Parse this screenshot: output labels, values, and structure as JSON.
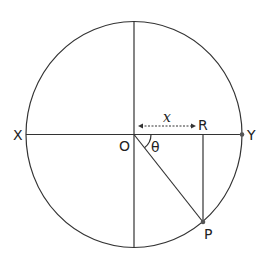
{
  "diagram": {
    "labels": {
      "X": "X",
      "Y": "Y",
      "O": "O",
      "R": "R",
      "P": "P",
      "theta": "θ",
      "x": "x"
    },
    "colors": {
      "stroke": "#333333",
      "point": "#555555",
      "background": "#ffffff"
    }
  }
}
